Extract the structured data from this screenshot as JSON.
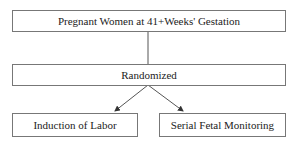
{
  "diagram": {
    "nodes": {
      "population": "Pregnant Women at 41+Weeks' Gestation",
      "randomized": "Randomized",
      "arm_left": "Induction of Labor",
      "arm_right": "Serial Fetal Monitoring"
    },
    "edges": [
      {
        "from": "population",
        "to": "randomized",
        "style": "line"
      },
      {
        "from": "randomized",
        "to": "arm_left",
        "style": "arrow"
      },
      {
        "from": "randomized",
        "to": "arm_right",
        "style": "arrow"
      }
    ],
    "colors": {
      "border": "#777777",
      "line": "#444444",
      "text": "#222222"
    }
  }
}
